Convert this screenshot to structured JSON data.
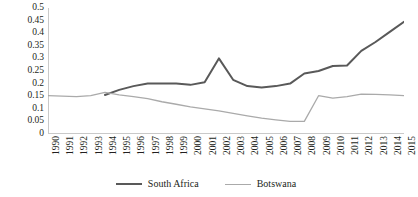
{
  "chart_data": {
    "type": "line",
    "title": "",
    "subtitle": "",
    "xlabel": "",
    "ylabel": "",
    "grid": false,
    "legend_position": "bottom-center",
    "x": [
      1990,
      1991,
      1992,
      1993,
      1994,
      1995,
      1996,
      1997,
      1998,
      1999,
      2000,
      2001,
      2002,
      2003,
      2004,
      2005,
      2006,
      2007,
      2008,
      2009,
      2010,
      2011,
      2012,
      2013,
      2014,
      2015
    ],
    "xtick_labels": [
      "1990",
      "1991",
      "1992",
      "1993",
      "1994",
      "1995",
      "1996",
      "1997",
      "1998",
      "1999",
      "2000",
      "2001",
      "2002",
      "2003",
      "2004",
      "2005",
      "2006",
      "2007",
      "2008",
      "2009",
      "2010",
      "2011",
      "2012",
      "2013",
      "2014",
      "2015"
    ],
    "ytick_labels": [
      "0.5",
      "0.45",
      "0.4",
      "0.35",
      "0.3",
      "0.25",
      "0.2",
      "0.15",
      "0.1",
      "0.05",
      "0"
    ],
    "ytick_values": [
      0.5,
      0.45,
      0.4,
      0.35,
      0.3,
      0.25,
      0.2,
      0.15,
      0.1,
      0.05,
      0
    ],
    "ylim": [
      0,
      0.5
    ],
    "xlim": [
      1990,
      2015
    ],
    "series": [
      {
        "name": "South Africa",
        "color": "#595959",
        "width": 2,
        "values": [
          null,
          null,
          null,
          null,
          0.155,
          0.175,
          0.19,
          0.2,
          0.2,
          0.2,
          0.195,
          0.205,
          0.3,
          0.215,
          0.19,
          0.185,
          0.19,
          0.2,
          0.24,
          0.25,
          0.27,
          0.272,
          0.33,
          0.365,
          0.405,
          0.445
        ]
      },
      {
        "name": "Botswana",
        "color": "#aaaaaa",
        "width": 1.3,
        "values": [
          0.152,
          0.15,
          0.148,
          0.152,
          0.165,
          0.155,
          0.148,
          0.14,
          0.128,
          0.118,
          0.108,
          0.1,
          0.092,
          0.082,
          0.072,
          0.063,
          0.056,
          0.05,
          0.05,
          0.152,
          0.142,
          0.148,
          0.158,
          0.157,
          0.155,
          0.152
        ]
      }
    ]
  },
  "legend": {
    "entries": [
      {
        "label": "South Africa",
        "swatch": "line-swatch-dark"
      },
      {
        "label": "Botswana",
        "swatch": "line-swatch-light"
      }
    ]
  },
  "colors": {
    "south_africa": "#595959",
    "botswana": "#aaaaaa",
    "axis": "#c9c9c9",
    "text": "#231f20",
    "background": "#ffffff"
  }
}
